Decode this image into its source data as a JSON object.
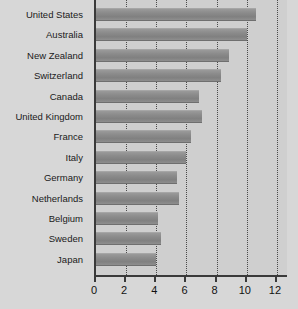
{
  "chart_data": {
    "type": "bar",
    "orientation": "horizontal",
    "title": "",
    "xlabel": "",
    "ylabel": "",
    "xlim": [
      0,
      12.8
    ],
    "xticks": [
      0,
      2,
      4,
      6,
      8,
      10,
      12
    ],
    "xtick_labels": [
      "0",
      "2",
      "4",
      "6",
      "8",
      "10",
      "12"
    ],
    "grid": true,
    "grid_axis": "x",
    "grid_style": "dotted",
    "legend": false,
    "categories": [
      "United States",
      "Australia",
      "New Zealand",
      "Switzerland",
      "Canada",
      "United Kingdom",
      "France",
      "Italy",
      "Germany",
      "Netherlands",
      "Belgium",
      "Sweden",
      "Japan"
    ],
    "values": [
      10.6,
      10.0,
      8.8,
      8.3,
      6.8,
      7.0,
      6.3,
      6.0,
      5.4,
      5.5,
      4.1,
      4.3,
      4.0
    ],
    "colors": {
      "bar": "#8b8b8b",
      "bar_top": "#9a9a9a",
      "bar_bottom": "#6f6f6f",
      "plot_background": "#cfcfcf",
      "page_background": "#d7d7d7",
      "axis": "#3a3a3a",
      "gridline": "#4a4a4a",
      "text": "#111111"
    }
  }
}
